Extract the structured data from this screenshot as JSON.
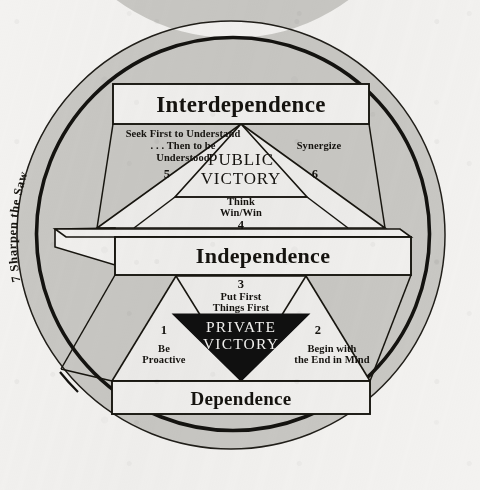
{
  "diagram": {
    "background_color": "#f3f2f0",
    "ink_color": "#15130f",
    "ring_fill_color": "#c9c8c4",
    "private_victory_fill": "#101010"
  },
  "levels": {
    "top_band": "Interdependence",
    "middle_band": "Independence",
    "bottom_band": "Dependence"
  },
  "victories": {
    "public": "PUBLIC\nVICTORY",
    "public_line1": "PUBLIC",
    "public_line2": "VICTORY",
    "private": "PRIVATE\nVICTORY",
    "private_line1": "PRIVATE",
    "private_line2": "VICTORY"
  },
  "ring": {
    "habit_number": "7",
    "habit_label": "Sharpen the Saw",
    "full_text": "7  Sharpen the Saw"
  },
  "habits": [
    {
      "number": "1",
      "label": "Be\nProactive",
      "line1": "Be",
      "line2": "Proactive",
      "group": "Private Victory"
    },
    {
      "number": "2",
      "label": "Begin with\nthe End in Mind",
      "line1": "Begin with",
      "line2": "the End in Mind",
      "group": "Private Victory"
    },
    {
      "number": "3",
      "label": "Put First\nThings First",
      "line1": "Put First",
      "line2": "Things First",
      "group": "Private Victory"
    },
    {
      "number": "4",
      "label": "Think\nWin/Win",
      "line1": "Think",
      "line2": "Win/Win",
      "group": "Public Victory"
    },
    {
      "number": "5",
      "label": "Seek First to Understand\n. . . Then to be\nUnderstood",
      "line1": "Seek First to Understand",
      "line2": ". . . Then to be",
      "line3": "Understood",
      "group": "Public Victory"
    },
    {
      "number": "6",
      "label": "Synergize",
      "line1": "Synergize",
      "group": "Public Victory"
    },
    {
      "number": "7",
      "label": "Sharpen the Saw",
      "line1": "Sharpen the Saw",
      "group": "Renewal"
    }
  ]
}
